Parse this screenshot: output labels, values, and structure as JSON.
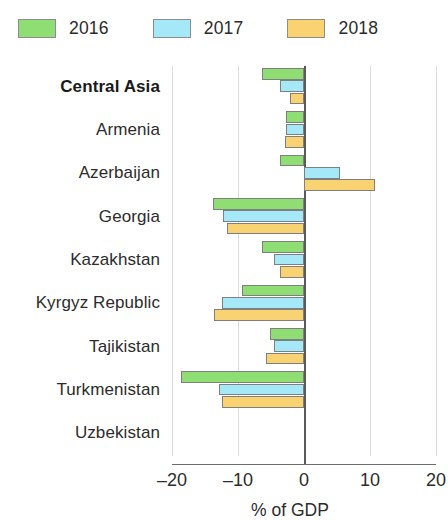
{
  "legend": {
    "items": [
      {
        "label": "2016",
        "color": "#8ede74"
      },
      {
        "label": "2017",
        "color": "#a5e8f7"
      },
      {
        "label": "2018",
        "color": "#f9d271"
      }
    ]
  },
  "axis": {
    "x_title": "% of GDP",
    "ticks": [
      "-20",
      "-10",
      "0",
      "10",
      "20"
    ],
    "tick_values": [
      -20,
      -10,
      0,
      10,
      20
    ]
  },
  "chart_data": {
    "type": "bar",
    "orientation": "horizontal",
    "title": "",
    "subtitle": "",
    "xlabel": "% of GDP",
    "ylabel": "",
    "xlim": [
      -20,
      20
    ],
    "xticks": [
      -20,
      -10,
      0,
      10,
      20
    ],
    "grid": true,
    "legend_position": "top",
    "categories": [
      "Central Asia",
      "Armenia",
      "Azerbaijan",
      "Georgia",
      "Kazakhstan",
      "Kyrgyz Republic",
      "Tajikistan",
      "Turkmenistan",
      "Uzbekistan"
    ],
    "highlighted_categories": [
      "Central Asia"
    ],
    "series": [
      {
        "name": "2016",
        "color": "#8ede74",
        "values": [
          -6.3,
          -2.8,
          -3.6,
          -13.8,
          -6.3,
          -9.4,
          -5.1,
          -18.7,
          0.0
        ]
      },
      {
        "name": "2017",
        "color": "#a5e8f7",
        "values": [
          -3.6,
          -2.8,
          5.4,
          -12.3,
          -4.5,
          -12.5,
          -4.6,
          -12.9,
          0.0
        ]
      },
      {
        "name": "2018",
        "color": "#f9d271",
        "values": [
          -2.1,
          -2.9,
          10.8,
          -11.7,
          -3.6,
          -13.6,
          -5.7,
          -12.4,
          0.0
        ]
      }
    ]
  }
}
